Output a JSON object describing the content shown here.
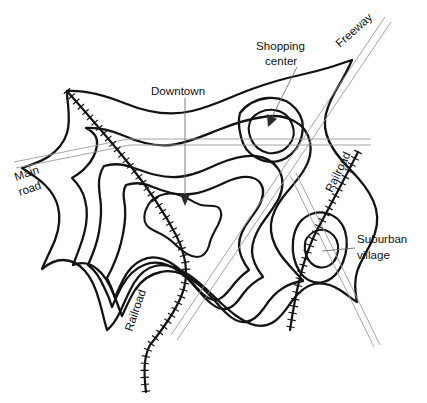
{
  "figure": {
    "background_color": "#ffffff",
    "contour_color": "#131313",
    "road_color": "#9a9a9a",
    "leader_color": "#6f6f6f",
    "width": 427,
    "height": 403
  },
  "labels": {
    "downtown": "Downtown",
    "shopping_center_line1": "Shopping",
    "shopping_center_line2": "center",
    "freeway": "Freeway",
    "main_road_line1": "Main",
    "main_road_line2": "road",
    "railroad_left": "Railroad",
    "railroad_right": "Railroad",
    "suburban_village_line1": "Suburban",
    "suburban_village_line2": "village"
  },
  "features": [
    {
      "name": "downtown",
      "kind": "peak",
      "label": "Downtown",
      "x": 185,
      "y": 205
    },
    {
      "name": "shopping-center",
      "kind": "peak",
      "label": "Shopping center",
      "x": 272,
      "y": 124
    },
    {
      "name": "suburban-village",
      "kind": "peak",
      "label": "Suburban village",
      "x": 320,
      "y": 252
    },
    {
      "name": "freeway",
      "kind": "transport-route",
      "label": "Freeway"
    },
    {
      "name": "main-road",
      "kind": "transport-route",
      "label": "Main road"
    },
    {
      "name": "railroad-left",
      "kind": "transport-route",
      "label": "Railroad"
    },
    {
      "name": "railroad-right",
      "kind": "transport-route",
      "label": "Railroad"
    }
  ]
}
